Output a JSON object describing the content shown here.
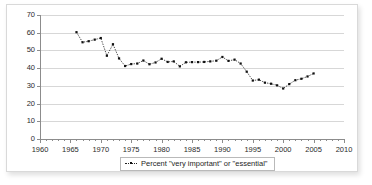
{
  "chart_data": {
    "type": "line",
    "title": "",
    "subtitle": "",
    "xlabel": "",
    "ylabel": "",
    "xlim": [
      1960,
      2010
    ],
    "ylim": [
      0,
      70
    ],
    "y_ticks": [
      0,
      10,
      20,
      30,
      40,
      50,
      60,
      70
    ],
    "x_ticks": [
      1960,
      1965,
      1970,
      1975,
      1980,
      1985,
      1990,
      1995,
      2000,
      2005,
      2010
    ],
    "x_minor_tick_step": 1,
    "grid": "horizontal",
    "legend_position": "bottom",
    "marker": "square",
    "line_style": "dotted",
    "line_color": "#222222",
    "marker_color": "#111111",
    "series": [
      {
        "name": "Percent \"very important\" or \"essential\"",
        "x": [
          1966,
          1967,
          1968,
          1969,
          1970,
          1971,
          1972,
          1973,
          1974,
          1975,
          1976,
          1977,
          1978,
          1979,
          1980,
          1981,
          1982,
          1983,
          1984,
          1985,
          1986,
          1987,
          1988,
          1989,
          1990,
          1991,
          1992,
          1993,
          1994,
          1995,
          1996,
          1997,
          1998,
          1999,
          2000,
          2001,
          2002,
          2003,
          2004,
          2005
        ],
        "values": [
          60.3,
          54.6,
          55.2,
          56.1,
          57.0,
          47.0,
          53.5,
          45.5,
          41.2,
          42.3,
          42.6,
          44.3,
          42.2,
          43.2,
          45.3,
          43.5,
          43.8,
          41.0,
          43.3,
          43.4,
          43.4,
          43.5,
          43.8,
          44.2,
          46.3,
          44.1,
          44.8,
          42.6,
          38.0,
          33.0,
          33.5,
          31.8,
          31.2,
          30.3,
          28.5,
          31.0,
          33.2,
          34.0,
          35.3,
          37.0
        ]
      }
    ]
  },
  "legend": {
    "entry_label": "Percent \"very important\" or \"essential\"",
    "marker_icon": "dotted-line-with-square-marker-icon"
  }
}
